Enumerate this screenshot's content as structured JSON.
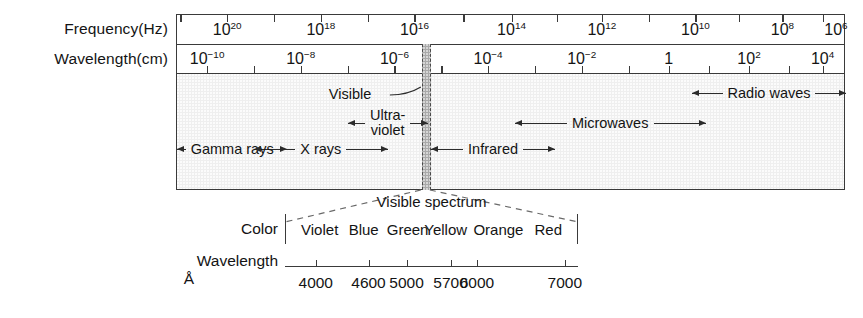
{
  "axes": {
    "frequency_label": "Frequency(Hz)",
    "wavelength_label": "Wavelength(cm)"
  },
  "detail_panel": {
    "color_label": "Color",
    "wavelength_label": "Wavelength",
    "angstrom_unit": "Å",
    "title": "Visible spectrum"
  },
  "visible_callout": "Visible",
  "colors": {
    "band_background": "#efefef",
    "visible_strip": "#a9a9a9",
    "line": "#3a3a3a",
    "text": "#141414"
  },
  "chart_data": {
    "type": "diagram",
    "frequency_ticks": {
      "label": "Frequency(Hz)",
      "unit": "Hz",
      "values": [
        "10^20",
        "10^18",
        "10^16",
        "10^14",
        "10^12",
        "10^10",
        "10^8",
        "10^6"
      ],
      "mantissa": [
        "10",
        "10",
        "10",
        "10",
        "10",
        "10",
        "10",
        "10"
      ],
      "exponents": [
        "20",
        "18",
        "16",
        "14",
        "12",
        "10",
        "8",
        "6"
      ],
      "x_fractions": [
        0.075,
        0.215,
        0.355,
        0.5,
        0.635,
        0.775,
        0.905,
        0.985
      ]
    },
    "wavelength_ticks": {
      "label": "Wavelength(cm)",
      "unit": "cm",
      "values": [
        "10^-10",
        "10^-8",
        "10^-6",
        "10^-4",
        "10^-2",
        "1",
        "10^2",
        "10^4"
      ],
      "mantissa": [
        "10",
        "10",
        "10",
        "10",
        "10",
        "1",
        "10",
        "10"
      ],
      "exponents": [
        "−10",
        "−8",
        "−6",
        "−4",
        "−2",
        "",
        "2",
        "4"
      ],
      "x_fractions": [
        0.045,
        0.185,
        0.325,
        0.465,
        0.605,
        0.735,
        0.855,
        0.965
      ]
    },
    "regions": [
      {
        "name": "Gamma rays",
        "x_start_frac": 0.0,
        "x_end_frac": 0.165,
        "row": 3
      },
      {
        "name": "X rays",
        "x_start_frac": 0.115,
        "x_end_frac": 0.315,
        "row": 3
      },
      {
        "name": "Ultra-violet",
        "x_start_frac": 0.255,
        "x_end_frac": 0.375,
        "row": 2
      },
      {
        "name": "Visible",
        "x_start_frac": 0.366,
        "x_end_frac": 0.379,
        "row": 1
      },
      {
        "name": "Infrared",
        "x_start_frac": 0.38,
        "x_end_frac": 0.565,
        "row": 3
      },
      {
        "name": "Microwaves",
        "x_start_frac": 0.505,
        "x_end_frac": 0.79,
        "row": 2
      },
      {
        "name": "Radio waves",
        "x_start_frac": 0.77,
        "x_end_frac": 1.0,
        "row": 1
      }
    ],
    "visible_spectrum": {
      "title": "Visible spectrum",
      "color_label": "Color",
      "wavelength_label": "Wavelength",
      "unit": "Å",
      "colors": [
        "Violet",
        "Blue",
        "Green",
        "Yellow",
        "Orange",
        "Red"
      ],
      "color_x_fractions": [
        0.115,
        0.265,
        0.415,
        0.545,
        0.725,
        0.895
      ],
      "wavelength_values": [
        4000,
        4600,
        5000,
        5700,
        6000,
        7000
      ],
      "wavelength_x_fractions": [
        0.105,
        0.285,
        0.415,
        0.565,
        0.655,
        0.955
      ],
      "xlim_angstrom": [
        3800,
        7200
      ]
    }
  },
  "regions": [
    {
      "label": "Gamma rays"
    },
    {
      "label": "X rays"
    },
    {
      "label": "Ultra-",
      "label2": "violet"
    },
    {
      "label": "Infrared"
    },
    {
      "label": "Microwaves"
    },
    {
      "label": "Radio waves"
    }
  ]
}
